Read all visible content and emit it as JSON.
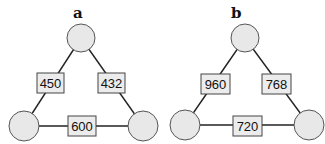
{
  "panels": [
    {
      "label": "a",
      "edges": {
        "left": "450",
        "right": "432",
        "bottom": "600"
      }
    },
    {
      "label": "b",
      "edges": {
        "left": "960",
        "right": "768",
        "bottom": "720"
      }
    }
  ],
  "colors": {
    "node_fill": "#e8e8e8",
    "box_fill": "#ececec",
    "line": "#222222"
  }
}
